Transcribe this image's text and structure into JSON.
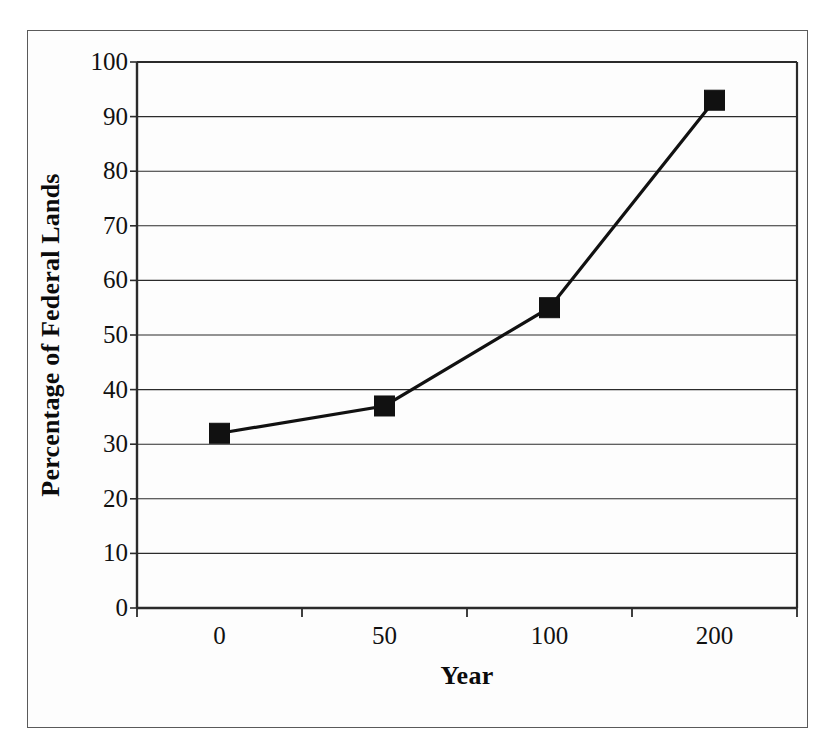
{
  "figure": {
    "background_color": "#fdfdfd",
    "frame_color": "#5a5a5a",
    "ink_color": "#111111"
  },
  "chart_data": {
    "type": "line",
    "title": "",
    "subtitle": "",
    "xlabel": "Year",
    "ylabel": "Percentage of Federal Lands",
    "categories": [
      "0",
      "50",
      "100",
      "200"
    ],
    "values": [
      32,
      37,
      55,
      93
    ],
    "series": [
      {
        "name": "Percentage of Federal Lands",
        "values": [
          32,
          37,
          55,
          93
        ],
        "line_color": "#111111",
        "marker": "square",
        "marker_color": "#111111"
      }
    ],
    "ylim": [
      0,
      100
    ],
    "ytick_labels": [
      "0",
      "10",
      "20",
      "30",
      "40",
      "50",
      "60",
      "70",
      "80",
      "90",
      "100"
    ],
    "ytick_values": [
      0,
      10,
      20,
      30,
      40,
      50,
      60,
      70,
      80,
      90,
      100
    ],
    "xtick_labels": [
      "0",
      "50",
      "100",
      "200"
    ],
    "grid": "horizontal",
    "grid_color": "#2b2b2b",
    "legend": "none",
    "legend_position": "none",
    "annotations": []
  }
}
